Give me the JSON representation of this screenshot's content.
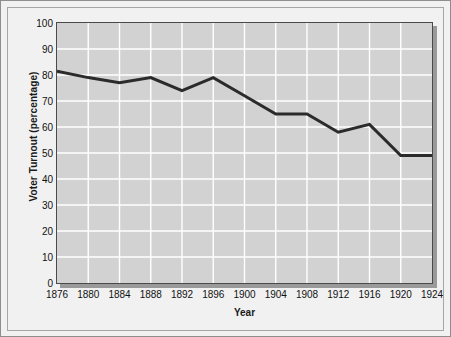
{
  "chart_data": {
    "type": "line",
    "title": "",
    "xlabel": "Year",
    "ylabel": "Voter Turnout (percentage)",
    "x": [
      1876,
      1880,
      1884,
      1888,
      1892,
      1896,
      1900,
      1904,
      1908,
      1912,
      1916,
      1920,
      1924
    ],
    "categories": [
      "1876",
      "1880",
      "1884",
      "1888",
      "1892",
      "1896",
      "1900",
      "1904",
      "1908",
      "1912",
      "1916",
      "1920",
      "1924"
    ],
    "values": [
      81.5,
      79,
      77,
      79,
      74,
      79,
      72,
      65,
      65,
      58,
      61,
      49,
      49
    ],
    "series": [
      {
        "name": "Voter Turnout",
        "values": [
          81.5,
          79,
          77,
          79,
          74,
          79,
          72,
          65,
          65,
          58,
          61,
          49,
          49
        ]
      }
    ],
    "xlim": [
      1876,
      1924
    ],
    "ylim": [
      0,
      100
    ],
    "yticks": [
      0,
      10,
      20,
      30,
      40,
      50,
      60,
      70,
      80,
      90,
      100
    ],
    "ytick_labels": [
      "0",
      "10",
      "20",
      "30",
      "40",
      "50",
      "60",
      "70",
      "80",
      "90",
      "100"
    ],
    "grid": true,
    "grid_color": "#ffffff",
    "legend": false,
    "legend_position": "none",
    "line_color": "#2b2b2b",
    "line_width": 3,
    "plot_background": "#d2d2d2",
    "figure_background": "#f1f1f1",
    "axis_color": "#4a4a4a"
  }
}
